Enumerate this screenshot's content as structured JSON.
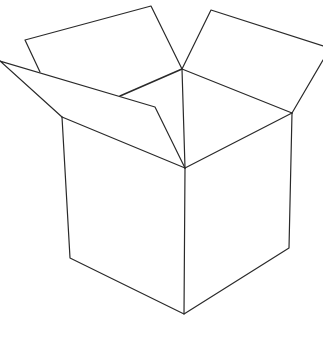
{
  "figure": {
    "style": "line drawing",
    "colors": {
      "background": "#ffffff",
      "line": "#2a2a2a"
    }
  }
}
